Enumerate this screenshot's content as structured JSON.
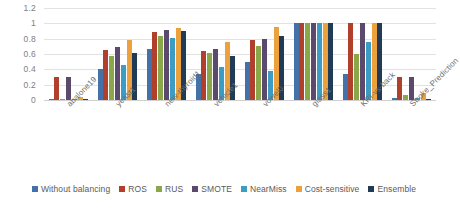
{
  "chart_data": {
    "type": "bar",
    "title": "",
    "subtitle": "",
    "xlabel": "",
    "ylabel": "",
    "ylim": [
      0,
      1.2
    ],
    "ytick_labels": [
      "1.2",
      "1",
      "0.8",
      "0.6",
      "0.4",
      "0.2",
      "0"
    ],
    "ytick_values": [
      1.2,
      1.0,
      0.8,
      0.6,
      0.4,
      0.2,
      0
    ],
    "grid": true,
    "legend_position": "bottom",
    "categories": [
      "abalone19",
      "yeast1",
      "new-thyroid1",
      "vehicle1",
      "vowel0",
      "glass1",
      "KRI-vs-back",
      "Stroke_Prediction"
    ],
    "series": [
      {
        "name": "Without balancing",
        "color": "#4472a8",
        "values": [
          0.01,
          0.4,
          0.67,
          0.34,
          0.5,
          1.0,
          0.34,
          0.02
        ]
      },
      {
        "name": "ROS",
        "color": "#b0402c",
        "values": [
          0.3,
          0.65,
          0.89,
          0.64,
          0.78,
          1.0,
          1.0,
          0.3
        ]
      },
      {
        "name": "RUS",
        "color": "#8aa84a",
        "values": [
          0.01,
          0.57,
          0.84,
          0.61,
          0.7,
          1.0,
          0.6,
          0.06
        ]
      },
      {
        "name": "SMOTE",
        "color": "#5b4a6e",
        "values": [
          0.3,
          0.69,
          0.91,
          0.66,
          0.8,
          1.0,
          1.0,
          0.3
        ]
      },
      {
        "name": "NearMiss",
        "color": "#3d9cc4",
        "values": [
          0.01,
          0.46,
          0.81,
          0.43,
          0.38,
          1.0,
          0.76,
          0.03
        ]
      },
      {
        "name": "Cost-sensitive",
        "color": "#eda13c",
        "values": [
          0.04,
          0.78,
          0.94,
          0.76,
          0.95,
          1.0,
          1.0,
          0.08
        ]
      },
      {
        "name": "Ensemble",
        "color": "#1f3b55",
        "values": [
          0.01,
          0.61,
          0.9,
          0.58,
          0.84,
          1.0,
          1.0,
          0.01
        ]
      }
    ]
  }
}
